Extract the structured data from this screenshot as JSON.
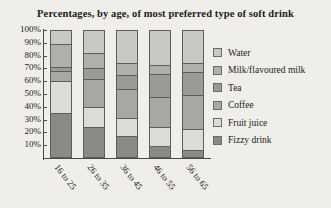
{
  "chart_data": {
    "type": "bar",
    "subtype": "stacked-percentage-column",
    "title": "Percentages, by age, of most preferred type of soft drink",
    "xlabel": "",
    "ylabel": "",
    "ylim": [
      0,
      100
    ],
    "grid": false,
    "legend_position": "right",
    "categories": [
      "16 to 25",
      "26 to 35",
      "36 to 45",
      "46 to 55",
      "56 to 65"
    ],
    "ytick_labels": [
      "100%",
      "90%",
      "80%",
      "70%",
      "60%",
      "50%",
      "40%",
      "30%",
      "20%",
      "10%"
    ],
    "ytick_values": [
      100,
      90,
      80,
      70,
      60,
      50,
      40,
      30,
      20,
      10
    ],
    "stack_order_bottom_to_top": [
      "Fizzy drink",
      "Fruit juice",
      "Coffee",
      "Tea",
      "Milk/flavoured milk",
      "Water"
    ],
    "series": [
      {
        "name": "Water",
        "color": "#c9c9c4",
        "values": [
          11,
          18,
          26,
          27,
          26
        ]
      },
      {
        "name": "Milk/flavoured milk",
        "color": "#b0b0ab",
        "values": [
          18,
          12,
          9,
          7,
          7
        ]
      },
      {
        "name": "Tea",
        "color": "#9b9b96",
        "values": [
          3,
          8,
          11,
          18,
          18
        ]
      },
      {
        "name": "Coffee",
        "color": "#a8a8a3",
        "values": [
          8,
          22,
          23,
          24,
          26
        ]
      },
      {
        "name": "Fruit juice",
        "color": "#dcdcd6",
        "values": [
          25,
          16,
          14,
          15,
          17
        ]
      },
      {
        "name": "Fizzy drink",
        "color": "#8a8a85",
        "values": [
          35,
          24,
          17,
          9,
          6
        ]
      }
    ]
  },
  "legend": {
    "items": [
      {
        "label": "Water"
      },
      {
        "label": "Milk/flavoured milk"
      },
      {
        "label": "Tea"
      },
      {
        "label": "Coffee"
      },
      {
        "label": "Fruit juice"
      },
      {
        "label": "Fizzy drink"
      }
    ]
  }
}
